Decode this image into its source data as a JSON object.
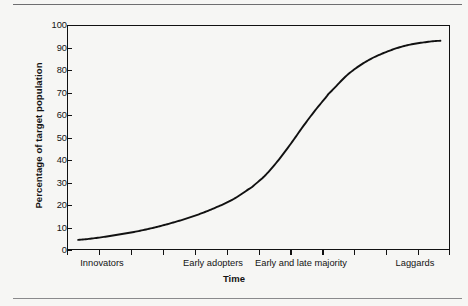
{
  "chart_data": {
    "type": "line",
    "title": "",
    "subtitle": "",
    "xlabel": "Time",
    "ylabel": "Percentage of target population",
    "ylim": [
      0,
      100
    ],
    "yticks": [
      0,
      10,
      20,
      30,
      40,
      50,
      60,
      70,
      80,
      90,
      100
    ],
    "ytick_labels": [
      "0",
      "10",
      "20",
      "30",
      "40",
      "50",
      "60",
      "70",
      "80",
      "90",
      "100"
    ],
    "grid": false,
    "legend": null,
    "legend_position": "none",
    "xlim": [
      0,
      12
    ],
    "xtick_count": 13,
    "categories": [
      "Innovators",
      "Early adopters",
      "Early and late majority",
      "Laggards"
    ],
    "category_positions": [
      1.1,
      4.6,
      7.3,
      10.9
    ],
    "series": [
      {
        "name": "Cumulative adoption",
        "color": "#111111",
        "x": [
          0.35,
          1.0,
          1.6,
          2.2,
          2.8,
          3.4,
          4.0,
          4.6,
          5.2,
          5.8,
          6.2,
          6.6,
          7.0,
          7.4,
          7.8,
          8.2,
          8.8,
          9.4,
          10.0,
          10.6,
          11.2,
          11.7
        ],
        "values": [
          4.5,
          5.5,
          6.8,
          8.3,
          10.2,
          12.5,
          15.2,
          18.5,
          22.5,
          28.0,
          33.0,
          39.5,
          47.0,
          55.0,
          62.5,
          69.5,
          78.0,
          84.0,
          88.0,
          90.8,
          92.3,
          93.0
        ]
      }
    ],
    "annotations": []
  },
  "figure": {
    "ylabel": "Percentage of target population",
    "xlabel": "Time",
    "ytick_labels": [
      "100",
      "90",
      "80",
      "70",
      "60",
      "50",
      "40",
      "30",
      "20",
      "10",
      "0"
    ],
    "xcategories": [
      "Innovators",
      "Early adopters",
      "Early and late majority",
      "Laggards"
    ]
  },
  "colors": {
    "page_background": "#f6f6f4",
    "axis": "#111111",
    "curve": "#111111",
    "rule": "#6e6e70",
    "text": "#131313"
  }
}
